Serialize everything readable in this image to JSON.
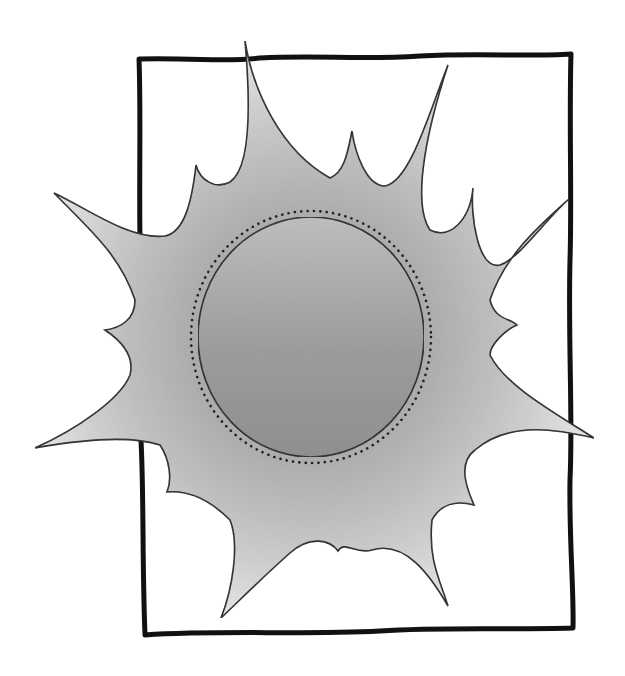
{
  "image": {
    "title": "Sun clip-art in hand-drawn frame",
    "description": "Grayscale starburst sun with a circular core, dotted ring, and a rough black rectangular frame",
    "subject": "sun",
    "ray_count": 16,
    "style": "black-and-white clip art",
    "colors": {
      "background": "#ffffff",
      "frame": "#111111",
      "outline": "#1a1a1a",
      "ray_tip": "#e6e6e6",
      "ray_outer": "#cfcfcf",
      "ray_mid": "#bdbdbd",
      "halo_inner": "#aaaaaa",
      "core_top": "#bdbdbd",
      "core_bottom": "#8c8c8c",
      "dots": "#222222"
    }
  }
}
